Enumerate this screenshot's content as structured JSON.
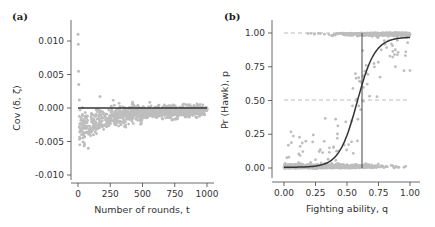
{
  "chart_data": [
    {
      "panel": "(a)",
      "type": "scatter",
      "xlabel": "Number of rounds, t",
      "ylabel": "Cov (δ, ζ)",
      "xlim": [
        0,
        1000
      ],
      "ylim": [
        -0.011,
        0.012
      ],
      "xticks": [
        "0",
        "250",
        "500",
        "750",
        "1000"
      ],
      "yticks": [
        "0.010",
        "0.005",
        "0.000",
        "-0.005",
        "-0.010"
      ],
      "grid": false,
      "reference_line": {
        "y": 0.0,
        "color": "#333333"
      },
      "point_color": "#bdbdbd",
      "description": "Covariance scatter that starts high (~0.011) near t=0, dips to ~-0.005 around t=50-100, then converges toward 0 by t=1000",
      "samples": [
        {
          "t": 0,
          "cov": 0.011
        },
        {
          "t": 2,
          "cov": 0.0095
        },
        {
          "t": 4,
          "cov": 0.0055
        },
        {
          "t": 6,
          "cov": 0.0035
        },
        {
          "t": 10,
          "cov": 0.0012
        },
        {
          "t": 20,
          "cov": -0.003
        },
        {
          "t": 50,
          "cov": -0.0055
        },
        {
          "t": 80,
          "cov": -0.006
        },
        {
          "t": 120,
          "cov": -0.004
        },
        {
          "t": 170,
          "cov": 0.0017
        },
        {
          "t": 250,
          "cov": -0.002
        },
        {
          "t": 500,
          "cov": -0.001
        },
        {
          "t": 750,
          "cov": -0.0005
        },
        {
          "t": 1000,
          "cov": -0.0002
        }
      ]
    },
    {
      "panel": "(b)",
      "type": "scatter",
      "xlabel": "Fighting ability, q",
      "ylabel": "Pr (Hawk), p",
      "xlim": [
        0,
        1
      ],
      "ylim": [
        0,
        1
      ],
      "xticks": [
        "0.00",
        "0.25",
        "0.50",
        "0.75",
        "1.00"
      ],
      "yticks": [
        "1.00",
        "0.75",
        "0.50",
        "0.25",
        "0.00"
      ],
      "grid": false,
      "dashed_lines": [
        {
          "y": 1.0
        },
        {
          "y": 0.5
        }
      ],
      "vertical_line": {
        "x": 0.61
      },
      "curve": {
        "type": "logistic",
        "midpoint": 0.58,
        "description": "sigmoid from ~0 at q=0 to ~0.97 at q=1"
      },
      "point_color": "#bdbdbd",
      "description": "Points cluster at p=0 for low q and at p=1 for high q, with scattered intermediate values around q=0.3-0.8"
    }
  ],
  "panels": {
    "a": {
      "label": "(a)",
      "xlabel": "Number of rounds, t",
      "ylabel": "Cov (δ, ζ)"
    },
    "b": {
      "label": "(b)",
      "xlabel": "Fighting ability, q",
      "ylabel": "Pr (Hawk), p"
    }
  }
}
